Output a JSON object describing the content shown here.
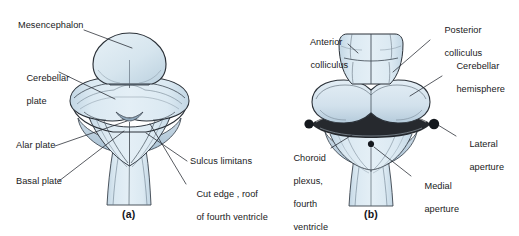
{
  "figure": {
    "background_color": "#ffffff",
    "fill_color": "#d3e2ec",
    "fill_color_light": "#e2edf4",
    "fill_color_dark": "#b9cedd",
    "outline_color": "#2b3138",
    "text_color": "#1a1a22"
  },
  "panels": [
    {
      "id": "a",
      "caption": "(a)",
      "labels": [
        {
          "name": "mesencephalon",
          "lines": [
            "Mesencephalon"
          ]
        },
        {
          "name": "cerebellar-plate",
          "lines": [
            "Cerebellar",
            "plate"
          ]
        },
        {
          "name": "alar-plate",
          "lines": [
            "Alar plate"
          ]
        },
        {
          "name": "basal-plate",
          "lines": [
            "Basal plate"
          ]
        },
        {
          "name": "sulcus-limitans",
          "lines": [
            "Sulcus limitans"
          ]
        },
        {
          "name": "cut-edge-roof-fourth-ventricle",
          "lines": [
            "Cut edge , roof",
            "of fourth ventricle"
          ]
        }
      ]
    },
    {
      "id": "b",
      "caption": "(b)",
      "labels": [
        {
          "name": "anterior-colliculus",
          "lines": [
            "Anterior",
            "colliculus"
          ]
        },
        {
          "name": "posterior-colliculus",
          "lines": [
            "Posterior",
            "colliculus"
          ]
        },
        {
          "name": "cerebellar-hemisphere",
          "lines": [
            "Cerebellar",
            "hemisphere"
          ]
        },
        {
          "name": "lateral-aperture",
          "lines": [
            "Lateral",
            "aperture"
          ]
        },
        {
          "name": "choroid-plexus-fourth-ventricle",
          "lines": [
            "Choroid",
            "plexus,",
            "fourth",
            "ventricle"
          ]
        },
        {
          "name": "medial-aperture",
          "lines": [
            "Medial",
            "aperture"
          ]
        }
      ]
    }
  ],
  "label_text": {
    "mesencephalon": "Mesencephalon",
    "cerebellar_plate_l1": "Cerebellar",
    "cerebellar_plate_l2": "plate",
    "alar_plate": "Alar plate",
    "basal_plate": "Basal plate",
    "sulcus_limitans": "Sulcus limitans",
    "cut_edge_l1": "Cut edge , roof",
    "cut_edge_l2": "of fourth ventricle",
    "caption_a": "(a)",
    "anterior_colliculus_l1": "Anterior",
    "anterior_colliculus_l2": "colliculus",
    "posterior_colliculus_l1": "Posterior",
    "posterior_colliculus_l2": "colliculus",
    "cerebellar_hemisphere_l1": "Cerebellar",
    "cerebellar_hemisphere_l2": "hemisphere",
    "lateral_aperture_l1": "Lateral",
    "lateral_aperture_l2": "aperture",
    "choroid_plexus_l1": "Choroid",
    "choroid_plexus_l2": "plexus,",
    "choroid_plexus_l3": "fourth",
    "choroid_plexus_l4": "ventricle",
    "medial_aperture_l1": "Medial",
    "medial_aperture_l2": "aperture",
    "caption_b": "(b)"
  }
}
